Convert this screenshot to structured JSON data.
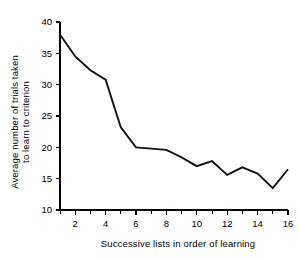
{
  "chart_data": {
    "type": "line",
    "title": "",
    "xlabel": "Successive lists in order of learning",
    "ylabel": "Average number of trials taken to learn to criterion",
    "ylabel_line1": "Average number of trials taken",
    "ylabel_line2": "to learn to criterion",
    "x": [
      1,
      2,
      3,
      4,
      5,
      6,
      7,
      8,
      9,
      10,
      11,
      12,
      13,
      14,
      15,
      16
    ],
    "values": [
      38.0,
      34.5,
      32.3,
      30.8,
      23.2,
      20.0,
      19.8,
      19.6,
      18.4,
      17.0,
      17.8,
      15.6,
      16.8,
      15.8,
      13.5,
      16.5
    ],
    "xlim": [
      1,
      16
    ],
    "ylim": [
      10,
      40
    ],
    "xticks": [
      1,
      2,
      3,
      4,
      5,
      6,
      7,
      8,
      9,
      10,
      11,
      12,
      13,
      14,
      15,
      16
    ],
    "xtick_labels": [
      "",
      "2",
      "",
      "4",
      "",
      "6",
      "",
      "8",
      "",
      "10",
      "",
      "12",
      "",
      "14",
      "",
      "16"
    ],
    "yticks": [
      10,
      15,
      20,
      25,
      30,
      35,
      40
    ],
    "ytick_labels": [
      "10",
      "15",
      "20",
      "25",
      "30",
      "35",
      "40"
    ],
    "grid": false,
    "legend": false,
    "line_color": "#111111",
    "axis_color": "#000000",
    "background_color": "#ffffff"
  }
}
